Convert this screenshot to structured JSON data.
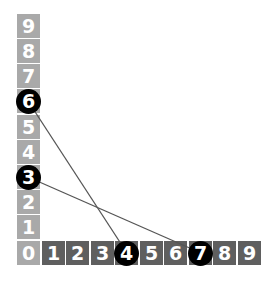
{
  "diagram": {
    "y_axis": {
      "labels": [
        "9",
        "8",
        "7",
        "6",
        "5",
        "4",
        "3",
        "2",
        "1"
      ],
      "color": "#a9a9a9"
    },
    "origin": {
      "label": "0",
      "color": "#a9a9a9"
    },
    "x_axis": {
      "labels": [
        "1",
        "2",
        "3",
        "4",
        "5",
        "6",
        "7",
        "8",
        "9"
      ],
      "color": "#5f5f5f"
    },
    "markers": [
      {
        "axis": "y",
        "label": "6"
      },
      {
        "axis": "y",
        "label": "3"
      },
      {
        "axis": "x",
        "label": "4"
      },
      {
        "axis": "x",
        "label": "7"
      }
    ],
    "connections": [
      {
        "from": "y6",
        "to": "x4"
      },
      {
        "from": "y3",
        "to": "x7"
      }
    ],
    "marker_color": "#000000",
    "line_color": "#555555"
  }
}
